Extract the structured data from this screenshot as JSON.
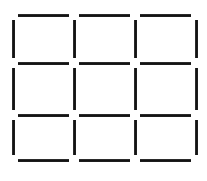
{
  "figure": {
    "name": "matchstick-grid-puzzle",
    "type": "matchstick-grid",
    "width": 207,
    "height": 181,
    "background_color": "#ffffff",
    "stick_color": "#1a1a1a",
    "stick_thickness": 2.5,
    "rows": 3,
    "columns": 3,
    "square_count": 9,
    "stick_count": 24,
    "horizontal_stick_count": 12,
    "vertical_stick_count": 12,
    "gap": 4,
    "grid_lines": {
      "vertical_x": [
        13,
        74,
        135,
        196
      ],
      "horizontal_y": [
        15,
        63,
        115,
        160
      ]
    },
    "horizontal_sticks": [
      {
        "id": "h-r0-c0",
        "row": 0,
        "col": 0,
        "x": 18,
        "y": 14,
        "length": 51
      },
      {
        "id": "h-r0-c1",
        "row": 0,
        "col": 1,
        "x": 79,
        "y": 14,
        "length": 51
      },
      {
        "id": "h-r0-c2",
        "row": 0,
        "col": 2,
        "x": 140,
        "y": 14,
        "length": 51
      },
      {
        "id": "h-r1-c0",
        "row": 1,
        "col": 0,
        "x": 18,
        "y": 62,
        "length": 51
      },
      {
        "id": "h-r1-c1",
        "row": 1,
        "col": 1,
        "x": 79,
        "y": 62,
        "length": 51
      },
      {
        "id": "h-r1-c2",
        "row": 1,
        "col": 2,
        "x": 140,
        "y": 62,
        "length": 51
      },
      {
        "id": "h-r2-c0",
        "row": 2,
        "col": 0,
        "x": 18,
        "y": 114,
        "length": 51
      },
      {
        "id": "h-r2-c1",
        "row": 2,
        "col": 1,
        "x": 79,
        "y": 114,
        "length": 51
      },
      {
        "id": "h-r2-c2",
        "row": 2,
        "col": 2,
        "x": 140,
        "y": 114,
        "length": 51
      },
      {
        "id": "h-r3-c0",
        "row": 3,
        "col": 0,
        "x": 18,
        "y": 159,
        "length": 51
      },
      {
        "id": "h-r3-c1",
        "row": 3,
        "col": 1,
        "x": 79,
        "y": 159,
        "length": 51
      },
      {
        "id": "h-r3-c2",
        "row": 3,
        "col": 2,
        "x": 140,
        "y": 159,
        "length": 51
      }
    ],
    "vertical_sticks": [
      {
        "id": "v-c0-r0",
        "col": 0,
        "row": 0,
        "x": 12,
        "y": 20,
        "length": 38
      },
      {
        "id": "v-c1-r0",
        "col": 1,
        "row": 0,
        "x": 73,
        "y": 20,
        "length": 38
      },
      {
        "id": "v-c2-r0",
        "col": 2,
        "row": 0,
        "x": 134,
        "y": 20,
        "length": 38
      },
      {
        "id": "v-c3-r0",
        "col": 3,
        "row": 0,
        "x": 195,
        "y": 20,
        "length": 38
      },
      {
        "id": "v-c0-r1",
        "col": 0,
        "row": 1,
        "x": 12,
        "y": 68,
        "length": 42
      },
      {
        "id": "v-c1-r1",
        "col": 1,
        "row": 1,
        "x": 73,
        "y": 68,
        "length": 42
      },
      {
        "id": "v-c2-r1",
        "col": 2,
        "row": 1,
        "x": 134,
        "y": 68,
        "length": 42
      },
      {
        "id": "v-c3-r1",
        "col": 3,
        "row": 1,
        "x": 195,
        "y": 68,
        "length": 42
      },
      {
        "id": "v-c0-r2",
        "col": 0,
        "row": 2,
        "x": 12,
        "y": 120,
        "length": 35
      },
      {
        "id": "v-c1-r2",
        "col": 1,
        "row": 2,
        "x": 73,
        "y": 120,
        "length": 35
      },
      {
        "id": "v-c2-r2",
        "col": 2,
        "row": 2,
        "x": 134,
        "y": 120,
        "length": 35
      },
      {
        "id": "v-c3-r2",
        "col": 3,
        "row": 2,
        "x": 195,
        "y": 120,
        "length": 35
      }
    ]
  }
}
